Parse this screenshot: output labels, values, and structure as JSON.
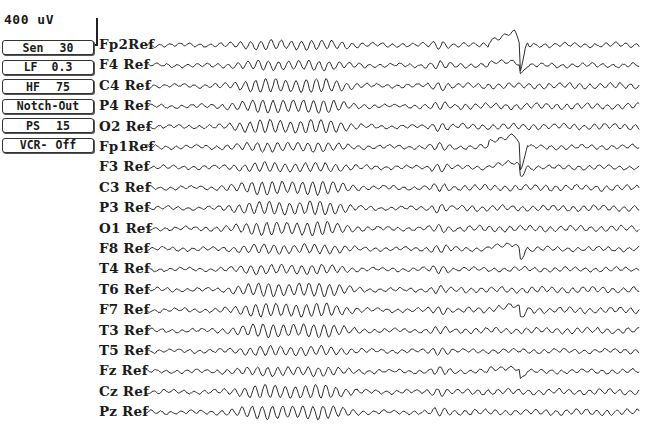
{
  "calibration": {
    "scale_label": "400 uV"
  },
  "settings_panel": {
    "buttons": [
      {
        "name": "Sen",
        "value": "30"
      },
      {
        "name": "LF",
        "value": "0.3"
      },
      {
        "name": "HF",
        "value": "75"
      },
      {
        "name": "Notch-Out",
        "value": ""
      },
      {
        "name": "PS",
        "value": "15"
      },
      {
        "name": "VCR-",
        "value": "Off"
      }
    ]
  },
  "montage": {
    "trace_color": "#2b2b2b",
    "channels": [
      {
        "label": "Fp2Ref",
        "artifact": "blink"
      },
      {
        "label": "F4 Ref",
        "artifact": "blink-small"
      },
      {
        "label": "C4 Ref",
        "artifact": "none"
      },
      {
        "label": "P4 Ref",
        "artifact": "none"
      },
      {
        "label": "O2 Ref",
        "artifact": "none"
      },
      {
        "label": "Fp1Ref",
        "artifact": "blink"
      },
      {
        "label": "F3 Ref",
        "artifact": "blink-small"
      },
      {
        "label": "C3 Ref",
        "artifact": "none"
      },
      {
        "label": "P3 Ref",
        "artifact": "none"
      },
      {
        "label": "O1 Ref",
        "artifact": "none"
      },
      {
        "label": "F8 Ref",
        "artifact": "blink-small"
      },
      {
        "label": "T4 Ref",
        "artifact": "none"
      },
      {
        "label": "T6 Ref",
        "artifact": "none"
      },
      {
        "label": "F7 Ref",
        "artifact": "blink-small"
      },
      {
        "label": "T3 Ref",
        "artifact": "none"
      },
      {
        "label": "T5 Ref",
        "artifact": "none"
      },
      {
        "label": "Fz Ref",
        "artifact": "blink-small"
      },
      {
        "label": "Cz Ref",
        "artifact": "none"
      },
      {
        "label": "Pz Ref",
        "artifact": "none"
      }
    ]
  }
}
